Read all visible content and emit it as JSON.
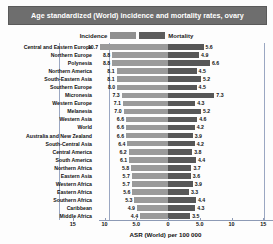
{
  "chart_data": {
    "type": "bar",
    "orientation": "horizontal-diverging",
    "title": "Age standardized (World) incidence and mortality rates, ovary",
    "xlabel": "ASR (World) per 100 000",
    "ylabel": "",
    "xlim": [
      -17.5,
      17.5
    ],
    "xticks": [
      "15",
      "10",
      "5.0",
      "0",
      "5.0",
      "10",
      "15"
    ],
    "xtick_values": [
      -15,
      -10,
      -5,
      0,
      5,
      10,
      15
    ],
    "grid": false,
    "legend": {
      "position": "top-center",
      "entries": [
        {
          "name": "Incidence",
          "color": "#9a9a9a"
        },
        {
          "name": "Mortality",
          "color": "#575757"
        }
      ]
    },
    "categories": [
      "Central and Eastern Europe",
      "Northern Europe",
      "Polynesia",
      "Northern America",
      "South-Eastern Asia",
      "Southern Europe",
      "Micronesia",
      "Western Europe",
      "Melanesia",
      "Western Asia",
      "World",
      "Australia and New Zealand",
      "South-Central Asia",
      "Central America",
      "South America",
      "Northern Africa",
      "Eastern Asia",
      "Western Africa",
      "Eastern Africa",
      "Southern Africa",
      "Caribbean",
      "Middle Africa"
    ],
    "series": [
      {
        "name": "Incidence",
        "color": "#9a9a9a",
        "values": [
          10.7,
          8.8,
          8.8,
          8.1,
          8.1,
          8.0,
          7.3,
          7.1,
          7.0,
          6.6,
          6.6,
          6.6,
          6.4,
          6.2,
          6.1,
          5.8,
          5.7,
          5.7,
          5.6,
          5.3,
          4.9,
          4.4
        ]
      },
      {
        "name": "Mortality",
        "color": "#575757",
        "values": [
          5.6,
          4.9,
          6.6,
          4.5,
          5.2,
          4.5,
          7.3,
          4.3,
          5.2,
          4.6,
          4.2,
          3.9,
          4.2,
          3.8,
          4.4,
          3.7,
          3.6,
          3.9,
          3.3,
          4.4,
          4.3,
          3.5
        ]
      }
    ],
    "rows": [
      {
        "category": "Central and Eastern Europe",
        "incidence": 10.7,
        "mortality": 5.6
      },
      {
        "category": "Northern Europe",
        "incidence": 8.8,
        "mortality": 4.9
      },
      {
        "category": "Polynesia",
        "incidence": 8.8,
        "mortality": 6.6
      },
      {
        "category": "Northern America",
        "incidence": 8.1,
        "mortality": 4.5
      },
      {
        "category": "South-Eastern Asia",
        "incidence": 8.1,
        "mortality": 5.2
      },
      {
        "category": "Southern Europe",
        "incidence": 8.0,
        "mortality": 4.5
      },
      {
        "category": "Micronesia",
        "incidence": 7.3,
        "mortality": 7.3
      },
      {
        "category": "Western Europe",
        "incidence": 7.1,
        "mortality": 4.3
      },
      {
        "category": "Melanesia",
        "incidence": 7.0,
        "mortality": 5.2
      },
      {
        "category": "Western Asia",
        "incidence": 6.6,
        "mortality": 4.6
      },
      {
        "category": "World",
        "incidence": 6.6,
        "mortality": 4.2
      },
      {
        "category": "Australia and New Zealand",
        "incidence": 6.6,
        "mortality": 3.9
      },
      {
        "category": "South-Central Asia",
        "incidence": 6.4,
        "mortality": 4.2
      },
      {
        "category": "Central America",
        "incidence": 6.2,
        "mortality": 3.8
      },
      {
        "category": "South America",
        "incidence": 6.1,
        "mortality": 4.4
      },
      {
        "category": "Northern Africa",
        "incidence": 5.8,
        "mortality": 3.7
      },
      {
        "category": "Eastern Asia",
        "incidence": 5.7,
        "mortality": 3.6
      },
      {
        "category": "Western Africa",
        "incidence": 5.7,
        "mortality": 3.9
      },
      {
        "category": "Eastern Africa",
        "incidence": 5.6,
        "mortality": 3.3
      },
      {
        "category": "Southern Africa",
        "incidence": 5.3,
        "mortality": 4.4
      },
      {
        "category": "Caribbean",
        "incidence": 4.9,
        "mortality": 4.3
      },
      {
        "category": "Middle Africa",
        "incidence": 4.4,
        "mortality": 3.5
      }
    ]
  }
}
